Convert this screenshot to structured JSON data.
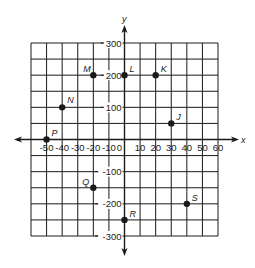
{
  "chart_data": {
    "type": "scatter",
    "title": "",
    "xlabel": "x",
    "ylabel": "y",
    "xlim": [
      -60,
      60
    ],
    "ylim": [
      -300,
      300
    ],
    "grid": true,
    "x_step": 10,
    "y_step": 50,
    "x_tick_labels": [
      "-50",
      "-40",
      "-30",
      "-20",
      "-10",
      "0",
      "10",
      "20",
      "30",
      "40",
      "50",
      "60"
    ],
    "y_tick_labels": [
      "300",
      "200",
      "100",
      "-100",
      "-200",
      "-300"
    ],
    "points": [
      {
        "label": "M",
        "x": -20,
        "y": 200
      },
      {
        "label": "L",
        "x": 0,
        "y": 200
      },
      {
        "label": "K",
        "x": 20,
        "y": 200
      },
      {
        "label": "N",
        "x": -40,
        "y": 100
      },
      {
        "label": "J",
        "x": 30,
        "y": 50
      },
      {
        "label": "P",
        "x": -50,
        "y": 0
      },
      {
        "label": "Q",
        "x": -20,
        "y": -150
      },
      {
        "label": "R",
        "x": 0,
        "y": -250
      },
      {
        "label": "S",
        "x": 40,
        "y": -200
      }
    ]
  },
  "colors": {
    "ink": "#1a1a1a",
    "background": "#ffffff"
  }
}
